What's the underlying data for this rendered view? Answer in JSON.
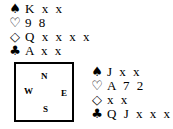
{
  "north": {
    "spades": {
      "symbol": "♠",
      "cards": "K x x"
    },
    "hearts": {
      "symbol": "♡",
      "cards": "9 8"
    },
    "diamonds": {
      "symbol": "◇",
      "cards": "Q x x x x"
    },
    "clubs": {
      "symbol": "♣",
      "cards": "A x x"
    }
  },
  "east": {
    "spades": {
      "symbol": "♠",
      "cards": "J x x"
    },
    "hearts": {
      "symbol": "♡",
      "cards": "A 7 2"
    },
    "diamonds": {
      "symbol": "◇",
      "cards": "x x"
    },
    "clubs": {
      "symbol": "♣",
      "cards": "Q J x x x"
    }
  },
  "compass": {
    "n": "N",
    "w": "W",
    "e": "E",
    "s": "S"
  }
}
